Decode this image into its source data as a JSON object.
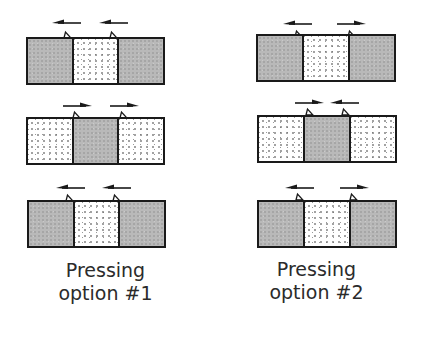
{
  "colors": {
    "outline": "#1a1a1a",
    "gray_fill": "#b9b9b9",
    "dotted_fill": "#ffffff",
    "text": "#2b2b2b"
  },
  "legend": {
    "gray": "shaded (gray) segment",
    "dots": "stippled (dotted) segment"
  },
  "options": [
    {
      "caption_line1": "Pressing",
      "caption_line2": "option #1",
      "rows": [
        {
          "segments": [
            "gray",
            "dots",
            "gray"
          ],
          "arrows": [
            "left",
            "left"
          ]
        },
        {
          "segments": [
            "dots",
            "gray",
            "dots"
          ],
          "arrows": [
            "right",
            "right"
          ]
        },
        {
          "segments": [
            "gray",
            "dots",
            "gray"
          ],
          "arrows": [
            "left",
            "left"
          ]
        }
      ]
    },
    {
      "caption_line1": "Pressing",
      "caption_line2": "option #2",
      "rows": [
        {
          "segments": [
            "gray",
            "dots",
            "gray"
          ],
          "arrows": [
            "left",
            "right"
          ]
        },
        {
          "segments": [
            "dots",
            "gray",
            "dots"
          ],
          "arrows": [
            "right",
            "left"
          ]
        },
        {
          "segments": [
            "gray",
            "dots",
            "gray"
          ],
          "arrows": [
            "left",
            "right"
          ]
        }
      ]
    }
  ]
}
